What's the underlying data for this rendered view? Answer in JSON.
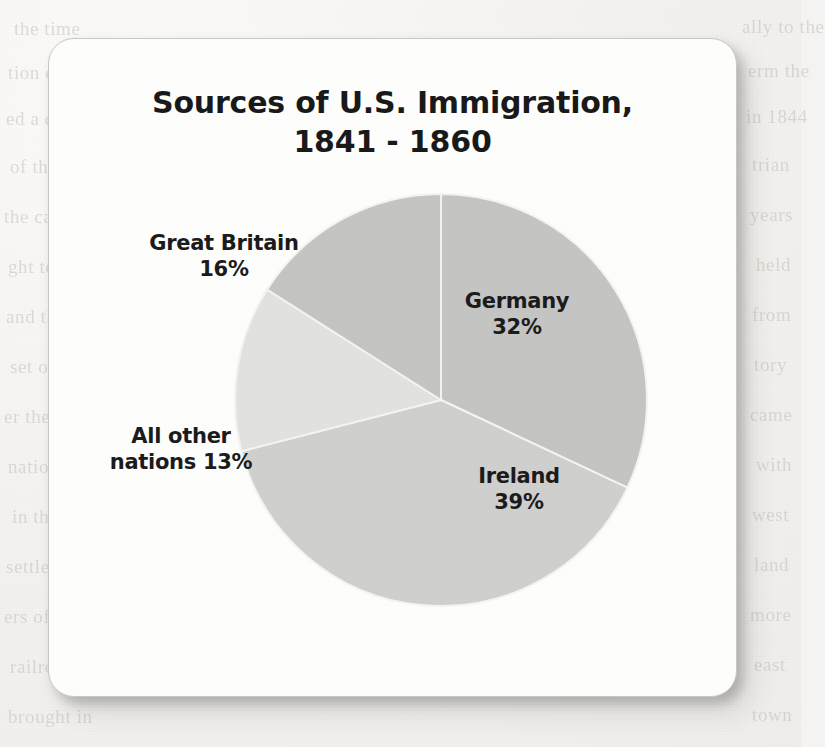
{
  "page": {
    "background_color": "#f2f1ee",
    "card_color": "#fdfdfc",
    "bleed_through_lines": [
      {
        "text": "the time",
        "x": 14,
        "y": 18
      },
      {
        "text": "ally to the",
        "x": 742,
        "y": 16
      },
      {
        "text": "tion of the",
        "x": 8,
        "y": 62
      },
      {
        "text": "erm the",
        "x": 748,
        "y": 60
      },
      {
        "text": "ed a com",
        "x": 6,
        "y": 108
      },
      {
        "text": "in 1844",
        "x": 746,
        "y": 106
      },
      {
        "text": "of the",
        "x": 10,
        "y": 156
      },
      {
        "text": "trian",
        "x": 752,
        "y": 154
      },
      {
        "text": "the canal",
        "x": 4,
        "y": 206
      },
      {
        "text": "years",
        "x": 750,
        "y": 204
      },
      {
        "text": "ght to",
        "x": 8,
        "y": 256
      },
      {
        "text": "held",
        "x": 756,
        "y": 254
      },
      {
        "text": "and the",
        "x": 6,
        "y": 306
      },
      {
        "text": "from",
        "x": 752,
        "y": 304
      },
      {
        "text": "set out",
        "x": 10,
        "y": 356
      },
      {
        "text": "tory",
        "x": 754,
        "y": 354
      },
      {
        "text": "er they",
        "x": 4,
        "y": 406
      },
      {
        "text": "came",
        "x": 750,
        "y": 404
      },
      {
        "text": "nations",
        "x": 8,
        "y": 456
      },
      {
        "text": "with",
        "x": 756,
        "y": 454
      },
      {
        "text": "in the",
        "x": 12,
        "y": 506
      },
      {
        "text": "west",
        "x": 752,
        "y": 504
      },
      {
        "text": "settlers",
        "x": 6,
        "y": 556
      },
      {
        "text": "land",
        "x": 754,
        "y": 554
      },
      {
        "text": "ers of the",
        "x": 4,
        "y": 606
      },
      {
        "text": "more",
        "x": 750,
        "y": 604
      },
      {
        "text": "railroad",
        "x": 10,
        "y": 656
      },
      {
        "text": "east",
        "x": 754,
        "y": 654
      },
      {
        "text": "brought in",
        "x": 8,
        "y": 706
      },
      {
        "text": "town",
        "x": 752,
        "y": 704
      }
    ]
  },
  "chart_data": {
    "type": "pie",
    "title": "Sources of U.S. Immigration,\n1841 - 1860",
    "xlabel": "",
    "ylabel": "",
    "legend_position": "none",
    "grid": false,
    "total": 100,
    "units": "percent",
    "categories": [
      "Germany",
      "Ireland",
      "All other nations",
      "Great Britain"
    ],
    "values": [
      32,
      39,
      13,
      16
    ],
    "slices": [
      {
        "name": "germany",
        "label": "Germany",
        "value_label": "32%",
        "label_text": "Germany\n32%",
        "value": 32,
        "color": "#c4c4c3",
        "start_angle_deg": 0,
        "end_angle_deg": 115.2
      },
      {
        "name": "ireland",
        "label": "Ireland",
        "value_label": "39%",
        "label_text": "Ireland\n39%",
        "value": 39,
        "color": "#cfcfce",
        "start_angle_deg": 115.2,
        "end_angle_deg": 255.6
      },
      {
        "name": "all-other-nations",
        "label": "All other nations",
        "value_label": "13%",
        "label_text": "All other\nnations 13%",
        "value": 13,
        "color": "#e1e1df",
        "start_angle_deg": 255.6,
        "end_angle_deg": 302.4
      },
      {
        "name": "great-britain",
        "label": "Great Britain",
        "value_label": "16%",
        "label_text": "Great Britain\n16%",
        "value": 16,
        "color": "#c4c4c3",
        "start_angle_deg": 302.4,
        "end_angle_deg": 360
      }
    ],
    "geometry": {
      "center_x": 392,
      "center_y": 361,
      "radius": 206
    }
  }
}
